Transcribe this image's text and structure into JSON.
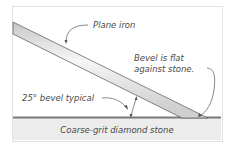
{
  "diagram": {
    "labels": {
      "plane_iron": "Plane iron",
      "bevel_flat_line1": "Bevel is flat",
      "bevel_flat_line2": "against stone.",
      "bevel_angle": "25° bevel typical",
      "stone": "Coarse-grit diamond stone"
    },
    "colors": {
      "stone_fill": "#ececec",
      "stone_top": "#7a7a7a",
      "iron_light": "#f4f4f4",
      "iron_dark": "#c9c9c9",
      "line": "#555555"
    }
  }
}
